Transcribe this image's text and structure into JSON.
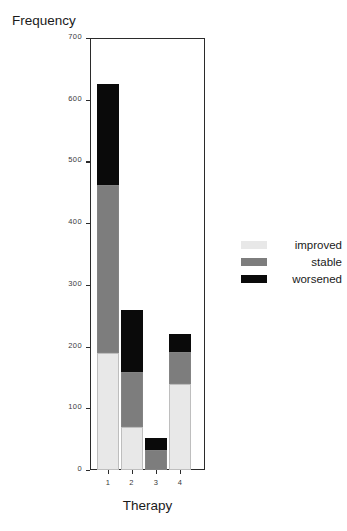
{
  "chart_data": {
    "type": "bar",
    "subtype": "stacked-bar",
    "title": "",
    "xlabel": "Therapy",
    "ylabel": "Frequency",
    "categories": [
      "1",
      "2",
      "3",
      "4"
    ],
    "ylim": [
      0,
      700
    ],
    "yticks": [
      0,
      100,
      200,
      300,
      400,
      500,
      600,
      700
    ],
    "ytick_labels": [
      "0",
      "100",
      "200",
      "300",
      "400",
      "500",
      "600",
      "700"
    ],
    "grid": false,
    "legend_position": "right",
    "series": [
      {
        "name": "improved",
        "color": "#e8e8e8",
        "values": [
          190,
          70,
          0,
          139
        ]
      },
      {
        "name": "stable",
        "color": "#7d7d7d",
        "values": [
          272,
          89,
          32,
          52
        ]
      },
      {
        "name": "worsened",
        "color": "#0a0a0a",
        "values": [
          163,
          101,
          20,
          29
        ]
      }
    ],
    "totals": [
      625,
      260,
      52,
      220
    ]
  },
  "legend": {
    "entries": [
      {
        "label": "improved",
        "color": "#e8e8e8"
      },
      {
        "label": "stable",
        "color": "#7d7d7d"
      },
      {
        "label": "worsened",
        "color": "#0a0a0a"
      }
    ]
  },
  "axes": {
    "y_title": "Frequency",
    "x_title": "Therapy"
  },
  "colors": {
    "improved": "#e8e8e8",
    "stable": "#7d7d7d",
    "worsened": "#0a0a0a",
    "axis": "#2b2b2b",
    "background": "#ffffff"
  }
}
